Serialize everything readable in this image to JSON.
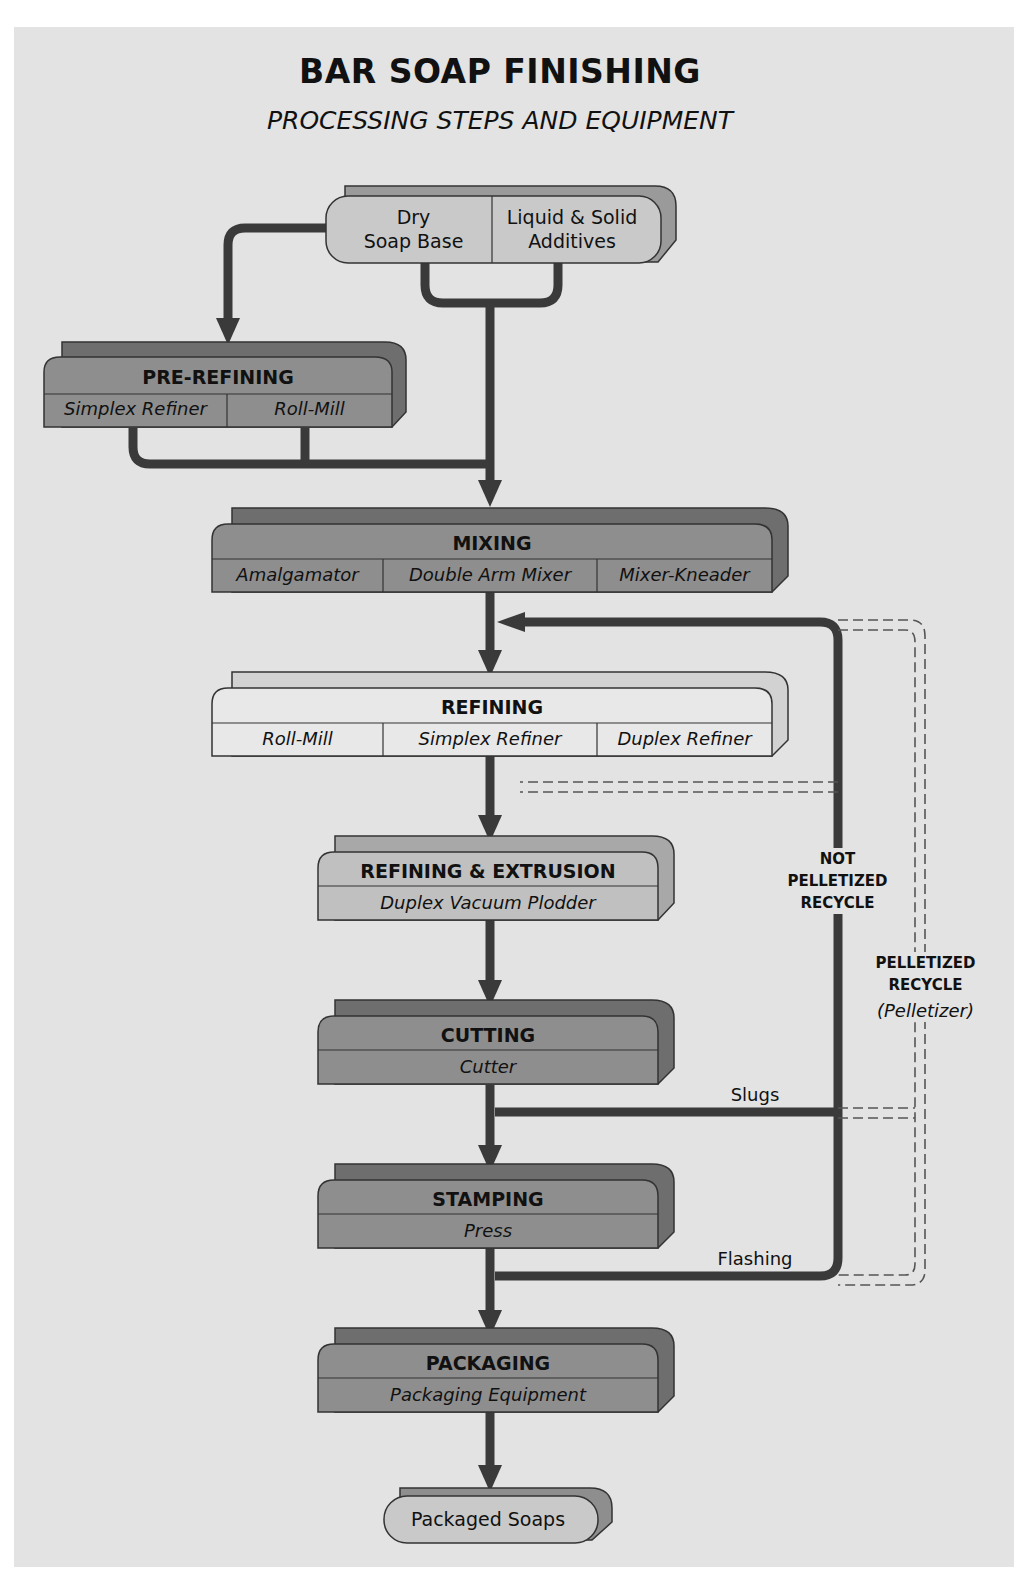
{
  "header": {
    "title": "BAR SOAP FINISHING",
    "subtitle": "PROCESSING STEPS AND EQUIPMENT"
  },
  "inputs": {
    "dry_soap_base": "Dry\nSoap Base",
    "dry_line1": "Dry",
    "dry_line2": "Soap Base",
    "additives_line1": "Liquid & Solid",
    "additives_line2": "Additives"
  },
  "steps": [
    {
      "name": "PRE-REFINING",
      "equipment": [
        "Simplex Refiner",
        "Roll-Mill"
      ],
      "shade": "#8c8c8c"
    },
    {
      "name": "MIXING",
      "equipment": [
        "Amalgamator",
        "Double Arm Mixer",
        "Mixer-Kneader"
      ],
      "shade": "#8c8c8c"
    },
    {
      "name": "REFINING",
      "equipment": [
        "Roll-Mill",
        "Simplex Refiner",
        "Duplex Refiner"
      ],
      "shade": "#e6e6e6"
    },
    {
      "name": "REFINING & EXTRUSION",
      "equipment": [
        "Duplex Vacuum Plodder"
      ],
      "shade": "#bdbdbd"
    },
    {
      "name": "CUTTING",
      "equipment": [
        "Cutter"
      ],
      "shade": "#8c8c8c"
    },
    {
      "name": "STAMPING",
      "equipment": [
        "Press"
      ],
      "shade": "#8c8c8c"
    },
    {
      "name": "PACKAGING",
      "equipment": [
        "Packaging Equipment"
      ],
      "shade": "#8c8c8c"
    }
  ],
  "output": {
    "label": "Packaged Soaps"
  },
  "recycle": {
    "not_pelletized_1": "NOT",
    "not_pelletized_2": "PELLETIZED",
    "not_pelletized_3": "RECYCLE",
    "pelletized_1": "PELLETIZED",
    "pelletized_2": "RECYCLE",
    "pelletized_3": "(Pelletizer)",
    "slugs": "Slugs",
    "flashing": "Flashing"
  }
}
